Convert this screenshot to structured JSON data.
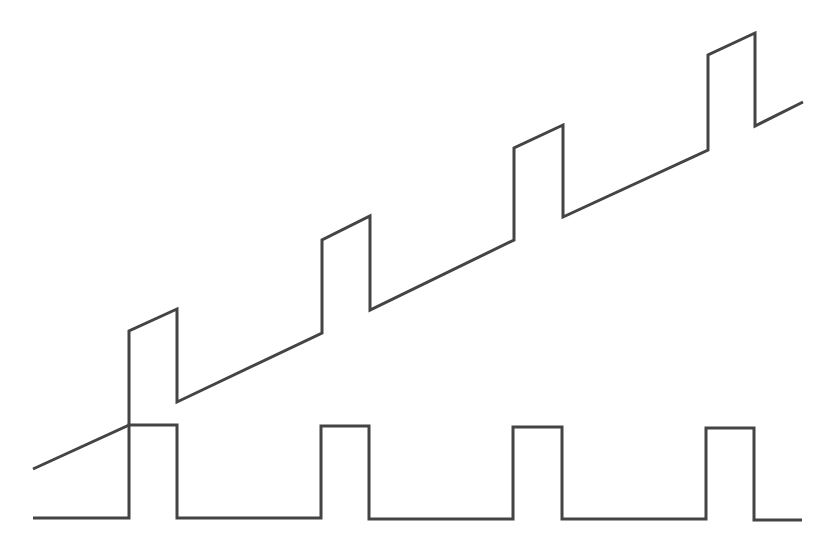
{
  "figure": {
    "background": "#ffffff",
    "stroke_color": "#444444",
    "stroke_width": 3,
    "waveforms": [
      {
        "name": "ramp-with-pulses",
        "points": [
          [
            33,
            469
          ],
          [
            129,
            425
          ],
          [
            129,
            331
          ],
          [
            177,
            309
          ],
          [
            177,
            402
          ],
          [
            322,
            333
          ],
          [
            322,
            240
          ],
          [
            370,
            216
          ],
          [
            370,
            310
          ],
          [
            514,
            240
          ],
          [
            514,
            148
          ],
          [
            563,
            125
          ],
          [
            563,
            217
          ],
          [
            708,
            150
          ],
          [
            708,
            55
          ],
          [
            755,
            33
          ],
          [
            755,
            126
          ],
          [
            803,
            102
          ]
        ]
      },
      {
        "name": "pulse-train",
        "points": [
          [
            33,
            518
          ],
          [
            129,
            518
          ],
          [
            129,
            425
          ],
          [
            177,
            425
          ],
          [
            177,
            518
          ],
          [
            321,
            518
          ],
          [
            321,
            426
          ],
          [
            369,
            426
          ],
          [
            369,
            519
          ],
          [
            513,
            519
          ],
          [
            513,
            427
          ],
          [
            562,
            427
          ],
          [
            562,
            519
          ],
          [
            706,
            519
          ],
          [
            706,
            428
          ],
          [
            754,
            428
          ],
          [
            754,
            520
          ],
          [
            802,
            520
          ]
        ]
      }
    ]
  }
}
